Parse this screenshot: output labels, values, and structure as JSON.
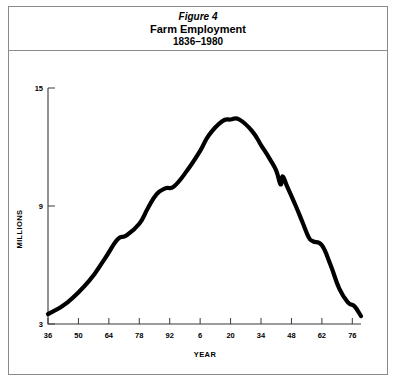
{
  "figure": {
    "number_label": "Figure 4",
    "title": "Farm Employment",
    "subtitle": "1836–1980"
  },
  "chart_data": {
    "type": "line",
    "title": "Farm Employment",
    "subtitle": "1836–1980",
    "xlabel": "YEAR",
    "ylabel": "MILLIONS",
    "xlim": [
      1836,
      1980
    ],
    "ylim": [
      3,
      15
    ],
    "grid": false,
    "legend": null,
    "line_color": "#000000",
    "x_tick_labels": [
      "36",
      "50",
      "64",
      "78",
      "92",
      "6",
      "20",
      "34",
      "48",
      "62",
      "76"
    ],
    "x_tick_years": [
      1836,
      1850,
      1864,
      1878,
      1892,
      1906,
      1920,
      1934,
      1948,
      1962,
      1976
    ],
    "y_tick_labels": [
      "15",
      "9",
      "3"
    ],
    "y_tick_values": [
      15,
      9,
      3
    ],
    "x": [
      1836,
      1845,
      1855,
      1862,
      1868,
      1872,
      1878,
      1882,
      1886,
      1890,
      1894,
      1900,
      1906,
      1910,
      1916,
      1920,
      1924,
      1930,
      1934,
      1938,
      1941,
      1943,
      1944,
      1946,
      1950,
      1953,
      1956,
      1958,
      1962,
      1966,
      1970,
      1974,
      1977,
      1980
    ],
    "y": [
      3.5,
      4.1,
      5.2,
      6.3,
      7.3,
      7.5,
      8.1,
      8.9,
      9.6,
      9.9,
      10.0,
      10.8,
      11.8,
      12.6,
      13.3,
      13.4,
      13.4,
      12.8,
      12.1,
      11.4,
      10.8,
      10.1,
      10.5,
      10.0,
      9.0,
      8.2,
      7.4,
      7.2,
      7.0,
      6.0,
      4.8,
      4.1,
      3.9,
      3.4
    ],
    "annotations": [
      {
        "label": "peak plateau",
        "x_range": [
          1916,
          1924
        ],
        "y": 13.4
      },
      {
        "label": "wartime uptick notch",
        "x": 1944,
        "y": 10.5
      },
      {
        "label": "late-1950s shelf",
        "x_range": [
          1956,
          1962
        ],
        "y": 7.1
      }
    ]
  }
}
